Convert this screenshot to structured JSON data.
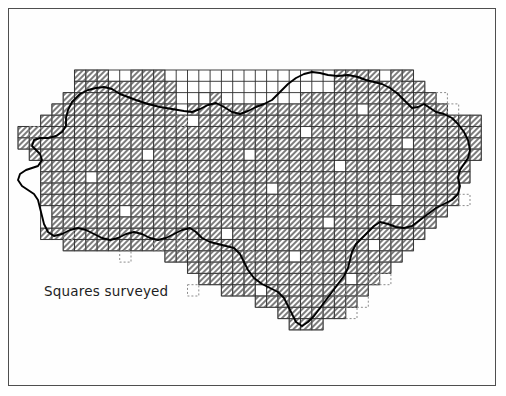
{
  "figure": {
    "caption": "Squares surveyed",
    "frame_color": "#3a3a3a",
    "background_color": "#ffffff"
  },
  "legend": {
    "surveyed_label": "Squares surveyed",
    "surveyed_fill": "#b5b5b5",
    "unsurveyed_fill": "#ffffff",
    "grid_line_color": "#2b2b2b",
    "square_edge_color": "#9a9a9a",
    "dashed_edge_color": "#8c8c8c",
    "boundary_color": "#000000"
  },
  "chart_data": {
    "type": "map",
    "title": "Squares surveyed",
    "grid": {
      "cell_size": 11.3,
      "origin_x": 18,
      "origin_y": 70,
      "columns": 41,
      "rows": 23,
      "note": "Each square represents one survey grid cell overlaid on the region boundary."
    },
    "categories": [
      "surveyed",
      "not surveyed",
      "outside boundary (dashed)"
    ],
    "values": [
      612,
      14,
      18
    ],
    "rows_filled": [
      {
        "row": 0,
        "spans": [
          [
            5,
            7
          ],
          [
            10,
            12
          ],
          [
            28,
            31
          ],
          [
            33,
            34
          ]
        ]
      },
      {
        "row": 1,
        "spans": [
          [
            5,
            13
          ],
          [
            28,
            35
          ]
        ]
      },
      {
        "row": 2,
        "spans": [
          [
            4,
            13
          ],
          [
            16,
            17
          ],
          [
            25,
            36
          ]
        ]
      },
      {
        "row": 3,
        "spans": [
          [
            3,
            13
          ],
          [
            15,
            37
          ]
        ]
      },
      {
        "row": 4,
        "spans": [
          [
            2,
            40
          ]
        ]
      },
      {
        "row": 5,
        "spans": [
          [
            0,
            40
          ]
        ]
      },
      {
        "row": 6,
        "spans": [
          [
            0,
            40
          ]
        ]
      },
      {
        "row": 7,
        "spans": [
          [
            1,
            40
          ]
        ]
      },
      {
        "row": 8,
        "spans": [
          [
            2,
            39
          ]
        ]
      },
      {
        "row": 9,
        "spans": [
          [
            2,
            39
          ]
        ]
      },
      {
        "row": 10,
        "spans": [
          [
            2,
            38
          ]
        ]
      },
      {
        "row": 11,
        "spans": [
          [
            2,
            38
          ]
        ]
      },
      {
        "row": 12,
        "spans": [
          [
            3,
            37
          ]
        ]
      },
      {
        "row": 13,
        "spans": [
          [
            3,
            36
          ]
        ]
      },
      {
        "row": 14,
        "spans": [
          [
            2,
            35
          ]
        ]
      },
      {
        "row": 15,
        "spans": [
          [
            4,
            34
          ]
        ]
      },
      {
        "row": 16,
        "spans": [
          [
            13,
            33
          ]
        ]
      },
      {
        "row": 17,
        "spans": [
          [
            15,
            32
          ]
        ]
      },
      {
        "row": 18,
        "spans": [
          [
            16,
            31
          ]
        ]
      },
      {
        "row": 19,
        "spans": [
          [
            18,
            30
          ]
        ]
      },
      {
        "row": 20,
        "spans": [
          [
            21,
            29
          ]
        ]
      },
      {
        "row": 21,
        "spans": [
          [
            23,
            28
          ]
        ]
      },
      {
        "row": 22,
        "spans": [
          [
            24,
            26
          ]
        ]
      }
    ],
    "blank_cells": [
      [
        2,
        16
      ],
      [
        3,
        30
      ],
      [
        4,
        15
      ],
      [
        5,
        25
      ],
      [
        6,
        34
      ],
      [
        7,
        11
      ],
      [
        7,
        20
      ],
      [
        8,
        28
      ],
      [
        9,
        6
      ],
      [
        10,
        22
      ],
      [
        11,
        33
      ],
      [
        12,
        9
      ],
      [
        13,
        27
      ],
      [
        14,
        18
      ],
      [
        15,
        31
      ],
      [
        16,
        24
      ],
      [
        18,
        29
      ],
      [
        19,
        21
      ]
    ],
    "xlabel": "",
    "ylabel": "",
    "grid_on": true,
    "legend_position": "bottom-left"
  }
}
